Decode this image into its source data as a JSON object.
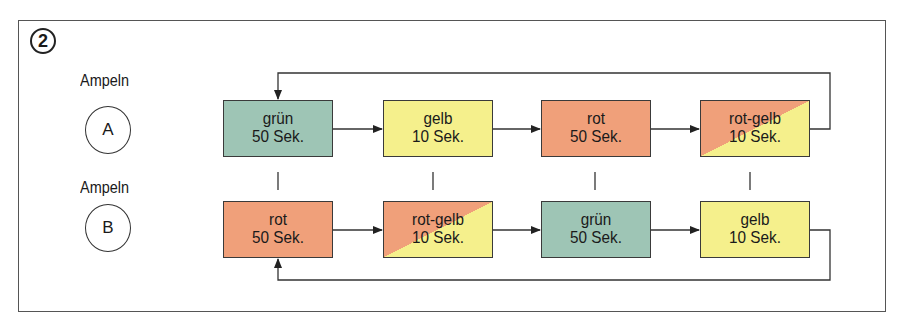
{
  "figure_number": "2",
  "colors": {
    "gruen": "#9ec5b5",
    "gelb": "#f5f08c",
    "rot": "#f0a07a",
    "line": "#333333"
  },
  "lights": [
    {
      "label": "Ampeln",
      "id": "A"
    },
    {
      "label": "Ampeln",
      "id": "B"
    }
  ],
  "row_a": [
    {
      "phase": "grün",
      "duration": "50 Sek.",
      "color": "gruen"
    },
    {
      "phase": "gelb",
      "duration": "10 Sek.",
      "color": "gelb"
    },
    {
      "phase": "rot",
      "duration": "50 Sek.",
      "color": "rot"
    },
    {
      "phase": "rot-gelb",
      "duration": "10 Sek.",
      "color": "rot-gelb"
    }
  ],
  "row_b": [
    {
      "phase": "rot",
      "duration": "50 Sek.",
      "color": "rot"
    },
    {
      "phase": "rot-gelb",
      "duration": "10 Sek.",
      "color": "rot-gelb"
    },
    {
      "phase": "grün",
      "duration": "50 Sek.",
      "color": "gruen"
    },
    {
      "phase": "gelb",
      "duration": "10 Sek.",
      "color": "gelb"
    }
  ]
}
